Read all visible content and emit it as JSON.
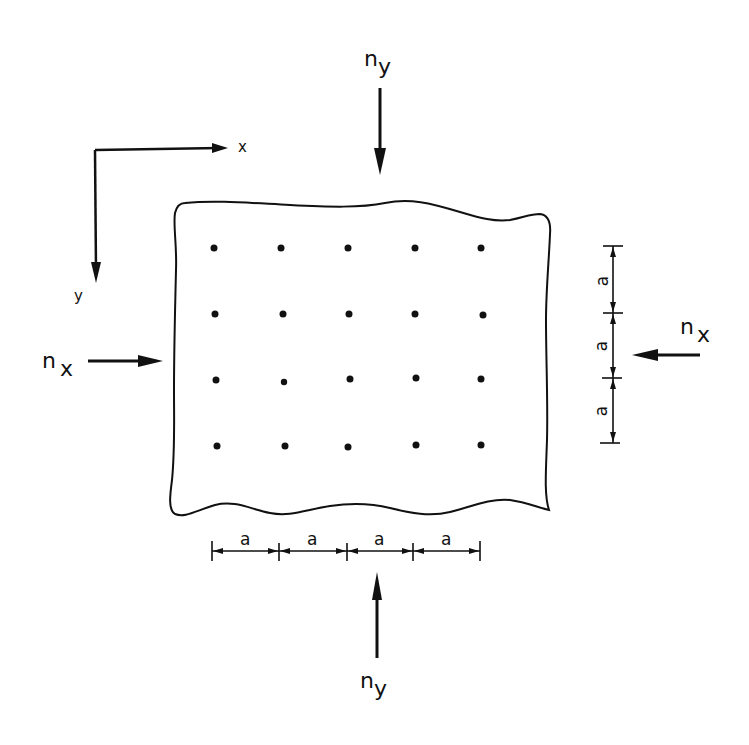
{
  "diagram": {
    "axes": {
      "x_label": "x",
      "y_label": "y"
    },
    "loads": {
      "top": {
        "label": "n",
        "sub": "y"
      },
      "bottom": {
        "label": "n",
        "sub": "y"
      },
      "left": {
        "label": "n",
        "sub": "x"
      },
      "right": {
        "label": "n",
        "sub": "x"
      }
    },
    "grid": {
      "columns": 5,
      "rows": 4,
      "spacing_label": "a"
    },
    "dimensions": {
      "horizontal": [
        "a",
        "a",
        "a",
        "a"
      ],
      "vertical": [
        "a",
        "a",
        "a"
      ]
    },
    "colors": {
      "ink": "#111111",
      "background": "#ffffff"
    }
  }
}
